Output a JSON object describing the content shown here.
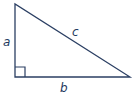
{
  "diagram": {
    "type": "right-triangle",
    "stroke_color": "#2b3f63",
    "vertices": {
      "top": [
        15,
        4
      ],
      "right_angle": [
        15,
        77
      ],
      "right": [
        130,
        77
      ]
    },
    "labels": {
      "a": "a",
      "b": "b",
      "c": "c"
    },
    "right_angle_marker": true
  }
}
